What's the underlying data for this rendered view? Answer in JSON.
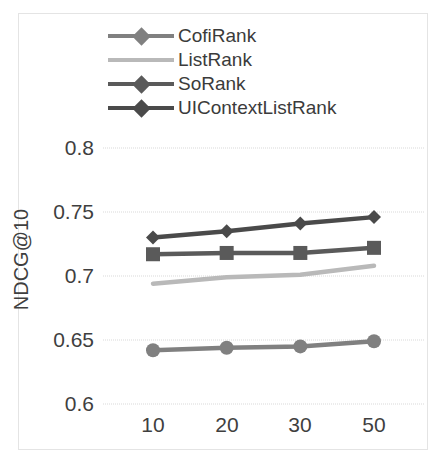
{
  "chart_data": {
    "type": "line",
    "title": "",
    "xlabel": "",
    "ylabel": "NDCG@10",
    "categories": [
      "10",
      "20",
      "30",
      "50"
    ],
    "x_tick_labels": [
      "10",
      "20",
      "30",
      "50"
    ],
    "y_tick_labels": [
      "0.6",
      "0.65",
      "0.7",
      "0.75",
      "0.8"
    ],
    "y_tick_values": [
      0.6,
      0.65,
      0.7,
      0.75,
      0.8
    ],
    "ylim": [
      0.6,
      0.8
    ],
    "grid": "horizontal",
    "legend_position": "top-center",
    "series": [
      {
        "name": "CofiRank",
        "values": [
          0.642,
          0.644,
          0.645,
          0.649
        ],
        "color": "#808080",
        "marker": "round"
      },
      {
        "name": "ListRank",
        "values": [
          0.694,
          0.699,
          0.701,
          0.708
        ],
        "color": "#b9b9b9",
        "marker": "none"
      },
      {
        "name": "SoRank",
        "values": [
          0.717,
          0.718,
          0.718,
          0.722
        ],
        "color": "#5a5a5a",
        "marker": "square"
      },
      {
        "name": "UIContextListRank",
        "values": [
          0.73,
          0.735,
          0.741,
          0.746
        ],
        "color": "#4a4a4a",
        "marker": "diamond"
      }
    ]
  },
  "legend": {
    "items": [
      {
        "label": "CofiRank"
      },
      {
        "label": "ListRank"
      },
      {
        "label": "SoRank"
      },
      {
        "label": "UIContextListRank"
      }
    ]
  },
  "axes": {
    "y_title": "NDCG@10",
    "y_labels": [
      "0.8",
      "0.75",
      "0.7",
      "0.65",
      "0.6"
    ],
    "x_labels": [
      "10",
      "20",
      "30",
      "50"
    ]
  },
  "colors": {
    "frame": "#e4e4e4",
    "gridline": "#d9d9d9",
    "text": "#3f3f3f",
    "background": "#ffffff"
  }
}
